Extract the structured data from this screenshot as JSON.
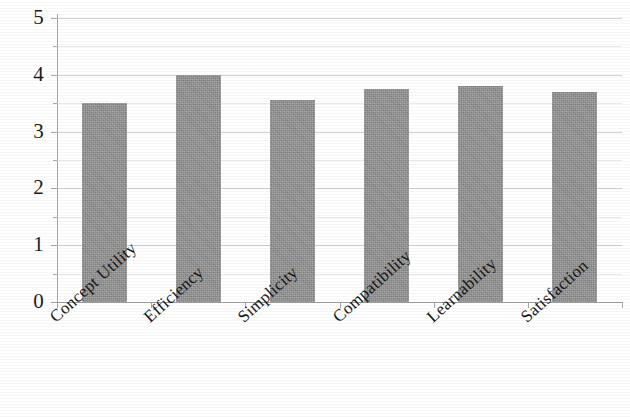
{
  "chart_data": {
    "type": "bar",
    "title": "",
    "subtitle": "",
    "xlabel": "",
    "ylabel": "",
    "categories": [
      "Concept Utility",
      "Efficiency",
      "Simplicity",
      "Compatibility",
      "Learnability",
      "Satisfaction"
    ],
    "values": [
      3.5,
      4.0,
      3.55,
      3.75,
      3.8,
      3.7
    ],
    "series": [
      {
        "name": "",
        "values": [
          3.5,
          4.0,
          3.55,
          3.75,
          3.8,
          3.7
        ]
      }
    ],
    "ylim": [
      0,
      5
    ],
    "xlim": [
      0,
      6
    ],
    "y_tick_labels": [
      "0",
      "1",
      "2",
      "3",
      "4",
      "5"
    ],
    "y_tick_values": [
      0,
      1,
      2,
      3,
      4,
      5
    ],
    "y_minor_tick_values": [
      0.5,
      1.5,
      2.5,
      3.5,
      4.5
    ],
    "grid": true,
    "grid_axis": "y",
    "legend": false,
    "legend_position": "none",
    "bar_color": "#8d8d8d",
    "gridline_color": "#c9c9c9",
    "axis_color": "#9e9e9e",
    "text_color": "#1c1c1c",
    "background_color": "#ffffff",
    "x_label_rotation": -42,
    "annotations": []
  }
}
